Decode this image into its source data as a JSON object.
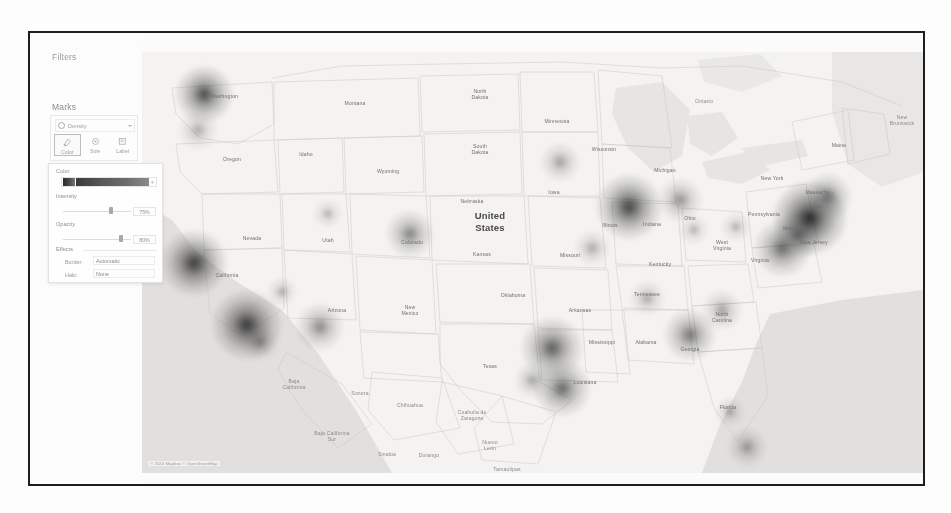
{
  "window": {
    "background_color": "#fdfdfd",
    "frame_color": "#1d1d1d"
  },
  "worksheet": {
    "filters_shelf_label": "Filters",
    "marks_card": {
      "title": "Marks",
      "mark_type": {
        "icon": "density-icon",
        "label": "Density",
        "caret": "chevron-down-icon"
      },
      "shelf_buttons": [
        {
          "id": "color",
          "label": "Color",
          "icon": "color-palette-icon",
          "active": true
        },
        {
          "id": "size",
          "label": "Size",
          "icon": "size-circle-icon",
          "active": false
        },
        {
          "id": "label",
          "label": "Label",
          "icon": "label-tag-icon",
          "active": false
        }
      ]
    }
  },
  "color_popup": {
    "color_section_label": "Color",
    "palette": {
      "name": "Density Multi-color Light",
      "swatch_colors": [
        "#2a2a2a",
        "#4d4d4d",
        "#767676"
      ],
      "caret": "chevron-down-icon"
    },
    "intensity": {
      "label": "Intensity",
      "value": "75%",
      "slider_percent": 70
    },
    "opacity": {
      "label": "Opacity",
      "value": "80%",
      "slider_percent": 82
    },
    "effects": {
      "label": "Effects",
      "border": {
        "label": "Border:",
        "value": "Automatic",
        "caret": "chevron-down-icon"
      },
      "halo": {
        "label": "Halo:",
        "value": "None",
        "caret": "chevron-down-icon"
      }
    }
  },
  "map": {
    "base_color": "#f4f3f1",
    "water_color": "#dcdcdc",
    "border_color": "#c9c7c4",
    "attribution": "© 2024 Mapbox © OpenStreetMap",
    "country_label": "United\nStates",
    "labels": [
      {
        "text": "Washington",
        "x": 82,
        "y": 44,
        "kind": "state"
      },
      {
        "text": "Montana",
        "x": 213,
        "y": 51,
        "kind": "state"
      },
      {
        "text": "North\nDakota",
        "x": 338,
        "y": 42,
        "kind": "state"
      },
      {
        "text": "Minnesota",
        "x": 415,
        "y": 69,
        "kind": "state"
      },
      {
        "text": "Oregon",
        "x": 90,
        "y": 107,
        "kind": "state"
      },
      {
        "text": "Idaho",
        "x": 164,
        "y": 102,
        "kind": "state"
      },
      {
        "text": "Wyoming",
        "x": 246,
        "y": 119,
        "kind": "state"
      },
      {
        "text": "South\nDakota",
        "x": 338,
        "y": 97,
        "kind": "state"
      },
      {
        "text": "Wisconsin",
        "x": 462,
        "y": 97,
        "kind": "state"
      },
      {
        "text": "Michigan",
        "x": 523,
        "y": 118,
        "kind": "state"
      },
      {
        "text": "Ontario",
        "x": 562,
        "y": 49,
        "kind": "province"
      },
      {
        "text": "Maine",
        "x": 697,
        "y": 93,
        "kind": "state"
      },
      {
        "text": "New\nBrunswick",
        "x": 760,
        "y": 68,
        "kind": "province"
      },
      {
        "text": "Iowa",
        "x": 412,
        "y": 140,
        "kind": "state"
      },
      {
        "text": "Nebraska",
        "x": 330,
        "y": 149,
        "kind": "state"
      },
      {
        "text": "Illinois",
        "x": 468,
        "y": 173,
        "kind": "state"
      },
      {
        "text": "Indiana",
        "x": 510,
        "y": 172,
        "kind": "state"
      },
      {
        "text": "Ohio",
        "x": 548,
        "y": 166,
        "kind": "state"
      },
      {
        "text": "New York",
        "x": 630,
        "y": 126,
        "kind": "state"
      },
      {
        "text": "Pennsylvania",
        "x": 622,
        "y": 162,
        "kind": "state"
      },
      {
        "text": "Massachu...",
        "x": 678,
        "y": 140,
        "kind": "state"
      },
      {
        "text": "Con...",
        "x": 678,
        "y": 154,
        "kind": "state"
      },
      {
        "text": "Nevada",
        "x": 110,
        "y": 186,
        "kind": "state"
      },
      {
        "text": "Utah",
        "x": 186,
        "y": 188,
        "kind": "state"
      },
      {
        "text": "Colorado",
        "x": 270,
        "y": 190,
        "kind": "state"
      },
      {
        "text": "Kansas",
        "x": 340,
        "y": 202,
        "kind": "state"
      },
      {
        "text": "Missouri",
        "x": 428,
        "y": 203,
        "kind": "state"
      },
      {
        "text": "Kentucky",
        "x": 518,
        "y": 212,
        "kind": "state"
      },
      {
        "text": "West\nVirginia",
        "x": 580,
        "y": 193,
        "kind": "state"
      },
      {
        "text": "Virginia",
        "x": 618,
        "y": 208,
        "kind": "state"
      },
      {
        "text": "New Jersey",
        "x": 672,
        "y": 190,
        "kind": "state"
      },
      {
        "text": "Maryland",
        "x": 652,
        "y": 176,
        "kind": "state"
      },
      {
        "text": "California",
        "x": 85,
        "y": 223,
        "kind": "state"
      },
      {
        "text": "Arizona",
        "x": 195,
        "y": 258,
        "kind": "state"
      },
      {
        "text": "New\nMexico",
        "x": 268,
        "y": 258,
        "kind": "state"
      },
      {
        "text": "Oklahoma",
        "x": 371,
        "y": 243,
        "kind": "state"
      },
      {
        "text": "Arkansas",
        "x": 438,
        "y": 258,
        "kind": "state"
      },
      {
        "text": "Tennessee",
        "x": 505,
        "y": 242,
        "kind": "state"
      },
      {
        "text": "North\nCarolina",
        "x": 580,
        "y": 265,
        "kind": "state"
      },
      {
        "text": "Mississippi",
        "x": 460,
        "y": 290,
        "kind": "state"
      },
      {
        "text": "Alabama",
        "x": 504,
        "y": 290,
        "kind": "state"
      },
      {
        "text": "Georgia",
        "x": 548,
        "y": 297,
        "kind": "state"
      },
      {
        "text": "Texas",
        "x": 348,
        "y": 314,
        "kind": "state"
      },
      {
        "text": "Louisiana",
        "x": 443,
        "y": 330,
        "kind": "state"
      },
      {
        "text": "Baja\nCalifornia",
        "x": 152,
        "y": 332,
        "kind": "province"
      },
      {
        "text": "Sonora",
        "x": 218,
        "y": 341,
        "kind": "province"
      },
      {
        "text": "Chihuahua",
        "x": 268,
        "y": 353,
        "kind": "province"
      },
      {
        "text": "Coahuila de\nZaragoza",
        "x": 330,
        "y": 363,
        "kind": "province"
      },
      {
        "text": "Baja California\nSur",
        "x": 190,
        "y": 384,
        "kind": "province"
      },
      {
        "text": "Sinaloa",
        "x": 245,
        "y": 402,
        "kind": "province"
      },
      {
        "text": "Durango",
        "x": 287,
        "y": 403,
        "kind": "province"
      },
      {
        "text": "Nuevo\nLeón",
        "x": 348,
        "y": 393,
        "kind": "province"
      },
      {
        "text": "Tamaulipas",
        "x": 365,
        "y": 417,
        "kind": "province"
      },
      {
        "text": "Florida",
        "x": 586,
        "y": 355,
        "kind": "state"
      }
    ],
    "density_points": [
      {
        "name": "seattle",
        "x": 62,
        "y": 42,
        "r": 13,
        "intensity": 0.66
      },
      {
        "name": "portland",
        "x": 56,
        "y": 78,
        "r": 9,
        "intensity": 0.22
      },
      {
        "name": "bay-area",
        "x": 52,
        "y": 211,
        "r": 15,
        "intensity": 0.72
      },
      {
        "name": "los-angeles",
        "x": 105,
        "y": 273,
        "r": 16,
        "intensity": 0.74
      },
      {
        "name": "san-diego",
        "x": 118,
        "y": 290,
        "r": 8,
        "intensity": 0.3
      },
      {
        "name": "phoenix",
        "x": 178,
        "y": 275,
        "r": 11,
        "intensity": 0.38
      },
      {
        "name": "las-vegas",
        "x": 140,
        "y": 240,
        "r": 7,
        "intensity": 0.2
      },
      {
        "name": "denver",
        "x": 268,
        "y": 182,
        "r": 11,
        "intensity": 0.4
      },
      {
        "name": "salt-lake-city",
        "x": 186,
        "y": 162,
        "r": 7,
        "intensity": 0.18
      },
      {
        "name": "dallas",
        "x": 410,
        "y": 296,
        "r": 14,
        "intensity": 0.58
      },
      {
        "name": "houston",
        "x": 420,
        "y": 336,
        "r": 13,
        "intensity": 0.52
      },
      {
        "name": "austin",
        "x": 390,
        "y": 328,
        "r": 8,
        "intensity": 0.26
      },
      {
        "name": "minneapolis",
        "x": 418,
        "y": 110,
        "r": 9,
        "intensity": 0.28
      },
      {
        "name": "chicago",
        "x": 487,
        "y": 155,
        "r": 15,
        "intensity": 0.7
      },
      {
        "name": "detroit",
        "x": 538,
        "y": 148,
        "r": 10,
        "intensity": 0.34
      },
      {
        "name": "st-louis",
        "x": 450,
        "y": 196,
        "r": 8,
        "intensity": 0.24
      },
      {
        "name": "atlanta",
        "x": 548,
        "y": 283,
        "r": 12,
        "intensity": 0.46
      },
      {
        "name": "nashville",
        "x": 505,
        "y": 246,
        "r": 8,
        "intensity": 0.24
      },
      {
        "name": "charlotte",
        "x": 580,
        "y": 258,
        "r": 9,
        "intensity": 0.28
      },
      {
        "name": "miami",
        "x": 605,
        "y": 395,
        "r": 9,
        "intensity": 0.3
      },
      {
        "name": "orlando",
        "x": 588,
        "y": 360,
        "r": 7,
        "intensity": 0.2
      },
      {
        "name": "washington-dc",
        "x": 640,
        "y": 196,
        "r": 13,
        "intensity": 0.52
      },
      {
        "name": "philadelphia",
        "x": 656,
        "y": 183,
        "r": 11,
        "intensity": 0.44
      },
      {
        "name": "new-york-city",
        "x": 668,
        "y": 166,
        "r": 17,
        "intensity": 0.84
      },
      {
        "name": "boston",
        "x": 686,
        "y": 145,
        "r": 11,
        "intensity": 0.42
      },
      {
        "name": "pittsburgh",
        "x": 594,
        "y": 175,
        "r": 7,
        "intensity": 0.18
      },
      {
        "name": "columbus",
        "x": 552,
        "y": 178,
        "r": 7,
        "intensity": 0.18
      }
    ]
  }
}
